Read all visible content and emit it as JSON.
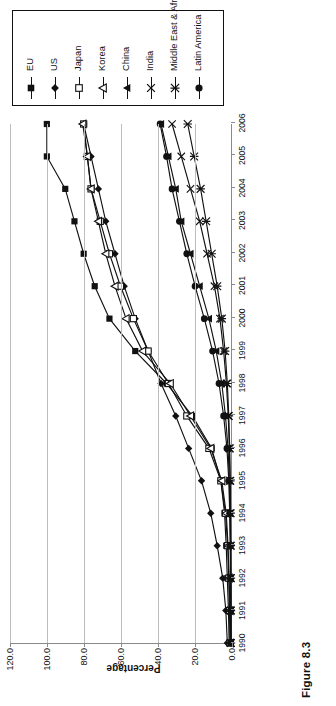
{
  "figure": {
    "caption": "Figure 8.3"
  },
  "chart_data": {
    "type": "line",
    "title": "",
    "xlabel": "",
    "ylabel": "Percentage",
    "ylim": [
      0.0,
      120.0
    ],
    "yticks": [
      "0.0",
      "20.0",
      "40.0",
      "60.0",
      "80.0",
      "100.0",
      "120.0"
    ],
    "ytick_values": [
      0.0,
      20.0,
      40.0,
      60.0,
      80.0,
      100.0,
      120.0
    ],
    "grid": true,
    "legend_position": "right",
    "x": [
      1990,
      1991,
      1992,
      1993,
      1994,
      1995,
      1996,
      1997,
      1998,
      1999,
      2000,
      2001,
      2002,
      2003,
      2004,
      2005,
      2006
    ],
    "categories": [
      "1990",
      "1991",
      "1992",
      "1993",
      "1994",
      "1995",
      "1996",
      "1997",
      "1998",
      "1999",
      "2000",
      "2001",
      "2002",
      "2003",
      "2004",
      "2005",
      "2006"
    ],
    "series": [
      {
        "name": "EU",
        "marker": "filled-square",
        "values": [
          1.0,
          1.4,
          2.0,
          2.6,
          3.5,
          5.5,
          10.5,
          21.0,
          35.0,
          52.0,
          66.0,
          74.0,
          80.0,
          85.0,
          90.0,
          100.0,
          100.0
        ]
      },
      {
        "name": "US",
        "marker": "filled-diamond",
        "values": [
          2.0,
          2.8,
          4.5,
          7.5,
          11.0,
          16.0,
          23.0,
          30.0,
          38.0,
          45.0,
          52.0,
          58.0,
          63.0,
          68.0,
          72.0,
          76.0,
          80.0
        ]
      },
      {
        "name": "Japan",
        "marker": "open-square",
        "values": [
          0.5,
          0.8,
          1.2,
          1.8,
          3.0,
          5.5,
          12.0,
          24.0,
          34.0,
          45.0,
          53.0,
          60.0,
          66.0,
          71.0,
          76.0,
          78.0,
          80.0
        ]
      },
      {
        "name": "Korea",
        "marker": "open-triangle",
        "values": [
          0.4,
          0.6,
          1.0,
          1.6,
          2.6,
          5.0,
          11.0,
          22.0,
          33.0,
          48.0,
          57.0,
          63.0,
          68.0,
          72.0,
          76.0,
          78.0,
          80.5
        ]
      },
      {
        "name": "China",
        "marker": "filled-triangle",
        "values": [
          0.1,
          0.15,
          0.2,
          0.3,
          0.5,
          0.9,
          1.6,
          3.0,
          5.0,
          8.0,
          12.0,
          17.0,
          22.0,
          27.0,
          30.0,
          34.0,
          38.0
        ]
      },
      {
        "name": "India",
        "marker": "x-cross",
        "values": [
          0.05,
          0.08,
          0.12,
          0.2,
          0.3,
          0.5,
          0.9,
          1.5,
          2.5,
          4.0,
          6.0,
          9.0,
          13.0,
          17.0,
          22.0,
          27.0,
          32.0
        ]
      },
      {
        "name": "Middle East & Africa",
        "marker": "asterisk",
        "values": [
          0.05,
          0.07,
          0.1,
          0.15,
          0.25,
          0.4,
          0.7,
          1.2,
          2.0,
          3.2,
          5.0,
          7.5,
          10.5,
          13.5,
          16.5,
          20.0,
          23.5
        ]
      },
      {
        "name": "Latin America",
        "marker": "filled-circle",
        "values": [
          0.1,
          0.15,
          0.25,
          0.4,
          0.7,
          1.2,
          2.2,
          4.0,
          6.5,
          10.0,
          14.5,
          19.5,
          24.0,
          28.0,
          32.0,
          35.0,
          38.5
        ]
      }
    ]
  }
}
